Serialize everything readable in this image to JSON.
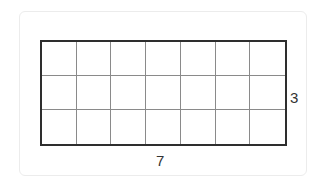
{
  "diagram": {
    "type": "rectangle-grid",
    "columns": 7,
    "rows": 3,
    "width_label": "7",
    "height_label": "3",
    "colors": {
      "outer_border": "#2e2e2e",
      "inner_lines": "#8a8a8a",
      "card_border": "#ececec"
    }
  }
}
